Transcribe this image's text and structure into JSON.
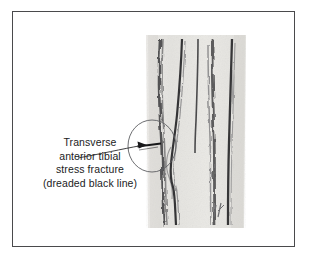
{
  "figure": {
    "frame_color": "#4a4a4c",
    "background_color": "#ffffff",
    "caption_lines": [
      "Transverse",
      "anterior tibial",
      "stress fracture",
      "(dreaded black line)"
    ],
    "caption_text": "Transverse anterior tibial stress fracture (dreaded black line)",
    "signature_initials": "JL"
  },
  "radiograph": {
    "film_color": "#e8e7e4",
    "ink_color": "#2b2b2d",
    "label": "lateral radiograph of tibia",
    "cortical_lines": [
      {
        "name": "anterior-cortex-outer",
        "x_top": 16,
        "x_bottom": 20
      },
      {
        "name": "anterior-cortex-inner",
        "x_top": 38,
        "x_bottom": 33
      },
      {
        "name": "medullary-line-central",
        "x_top": 54,
        "x_bottom": 52
      },
      {
        "name": "posterior-cortex-inner",
        "x_top": 68,
        "x_bottom": 70
      },
      {
        "name": "posterior-cortex-outer",
        "x_top": 88,
        "x_bottom": 84
      }
    ]
  },
  "annotation": {
    "circle": {
      "cx": 152,
      "cy": 146,
      "rx": 24,
      "ry": 26,
      "color": "#55565a"
    },
    "arrow": {
      "x1": 76,
      "y1": 156,
      "x2": 146,
      "y2": 145,
      "color": "#2b2b2d"
    },
    "fracture_line": {
      "name": "dreaded-black-line",
      "x1": 137,
      "y1": 145,
      "x2": 161,
      "y2": 144
    }
  }
}
